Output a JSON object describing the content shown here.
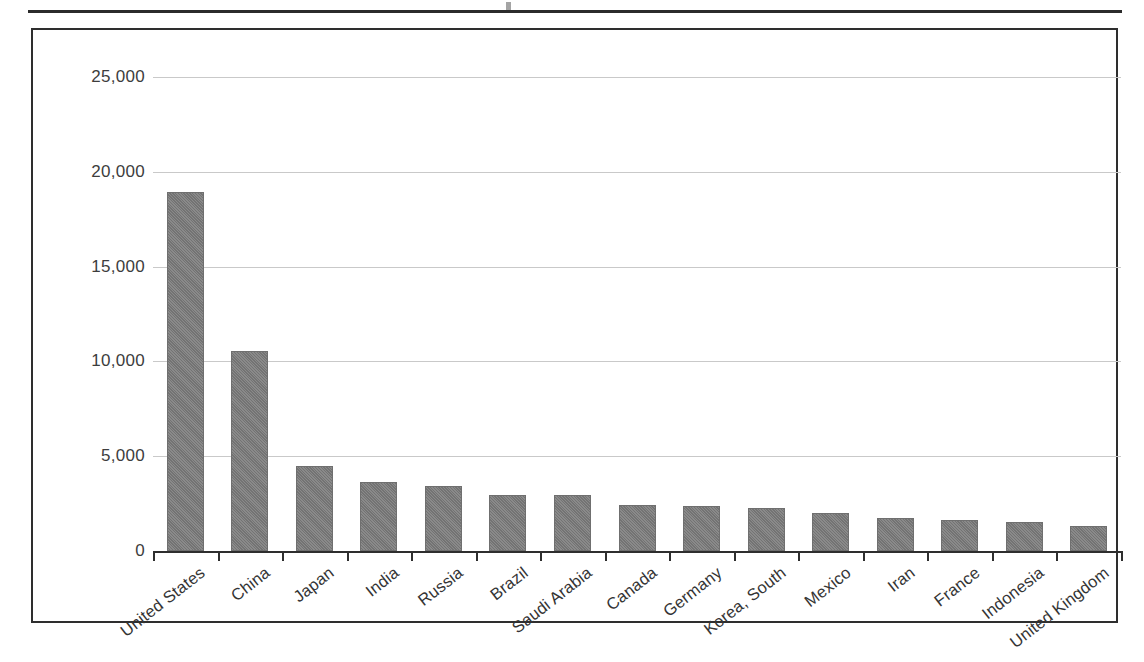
{
  "page": {
    "top_rule": "horizontal-rule"
  },
  "chart_data": {
    "type": "bar",
    "title": "",
    "xlabel": "",
    "ylabel": "",
    "ylim": [
      0,
      25000
    ],
    "yticks": [
      0,
      5000,
      10000,
      15000,
      20000,
      25000
    ],
    "ytick_labels": [
      "0",
      "5,000",
      "10,000",
      "15,000",
      "20,000",
      "25,000"
    ],
    "grid": true,
    "legend": "none",
    "bar_color": "#7d7d7d",
    "categories": [
      "United States",
      "China",
      "Japan",
      "India",
      "Russia",
      "Brazil",
      "Saudi Arabia",
      "Canada",
      "Germany",
      "Korea, South",
      "Mexico",
      "Iran",
      "France",
      "Indonesia",
      "United Kingdom"
    ],
    "values": [
      18950,
      10540,
      4500,
      3650,
      3450,
      2980,
      2950,
      2420,
      2400,
      2250,
      2000,
      1760,
      1640,
      1510,
      1340
    ]
  }
}
